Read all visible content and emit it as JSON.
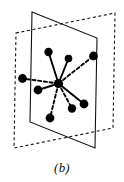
{
  "figure": {
    "caption": "(b)",
    "background_color": "#ffffff",
    "stroke_color": "#111111",
    "node_fill_color": "#000000"
  },
  "diagram": {
    "type": "geometric-bond-diagram",
    "viewbox": "0 0 124 182",
    "planes": [
      {
        "name": "solid-plane",
        "style": "solid",
        "stroke_width": 1.1,
        "points": "32,12 97,38 95,148 30,122"
      },
      {
        "name": "dashed-plane",
        "style": "dashed",
        "dash_pattern": "3,2.6",
        "stroke_width": 1.1,
        "points": "16,33 115,13 113,128 14,148"
      }
    ],
    "center_node": {
      "name": "central-atom",
      "cx": 58.5,
      "cy": 83.5,
      "r": 4.6
    },
    "nodes": [
      {
        "name": "atom-top-left",
        "cx": 48.5,
        "cy": 52.0,
        "r": 4.2,
        "bond": "solid"
      },
      {
        "name": "atom-top-middle",
        "cx": 68.5,
        "cy": 58.5,
        "r": 3.8,
        "bond": "solid"
      },
      {
        "name": "atom-top-right",
        "cx": 93.5,
        "cy": 56.0,
        "r": 4.4,
        "bond": "dashed"
      },
      {
        "name": "atom-left-far",
        "cx": 22.5,
        "cy": 78.5,
        "r": 4.4,
        "bond": "dashed"
      },
      {
        "name": "atom-left-near",
        "cx": 38.0,
        "cy": 90.0,
        "r": 4.4,
        "bond": "solid"
      },
      {
        "name": "atom-bottom-left",
        "cx": 50.0,
        "cy": 118.0,
        "r": 4.4,
        "bond": "dashed"
      },
      {
        "name": "atom-bottom-mid",
        "cx": 72.0,
        "cy": 108.5,
        "r": 4.2,
        "bond": "dashed"
      },
      {
        "name": "atom-bottom-right",
        "cx": 84.0,
        "cy": 104.0,
        "r": 4.4,
        "bond": "solid"
      }
    ],
    "bonds": [
      {
        "name": "bond-top-left",
        "style": "solid",
        "x1": 58.5,
        "y1": 83.5,
        "x2": 48.5,
        "y2": 52.0
      },
      {
        "name": "bond-top-middle",
        "style": "solid",
        "x1": 58.5,
        "y1": 83.5,
        "x2": 68.5,
        "y2": 58.5
      },
      {
        "name": "bond-top-right",
        "style": "dashed",
        "x1": 58.5,
        "y1": 83.5,
        "x2": 93.5,
        "y2": 56.0
      },
      {
        "name": "bond-left-far",
        "style": "dashed",
        "x1": 58.5,
        "y1": 83.5,
        "x2": 22.5,
        "y2": 78.5
      },
      {
        "name": "bond-left-near",
        "style": "solid",
        "x1": 58.5,
        "y1": 83.5,
        "x2": 38.0,
        "y2": 90.0
      },
      {
        "name": "bond-bottom-left",
        "style": "dashed",
        "x1": 58.5,
        "y1": 83.5,
        "x2": 50.0,
        "y2": 118.0
      },
      {
        "name": "bond-bottom-mid",
        "style": "dashed",
        "x1": 58.5,
        "y1": 83.5,
        "x2": 72.0,
        "y2": 108.5
      },
      {
        "name": "bond-bottom-right",
        "style": "solid",
        "x1": 58.5,
        "y1": 83.5,
        "x2": 84.0,
        "y2": 104.0
      }
    ]
  }
}
